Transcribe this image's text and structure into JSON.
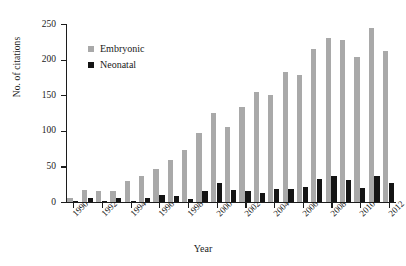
{
  "chart_data": {
    "type": "bar",
    "title": "",
    "xlabel": "Year",
    "ylabel": "No. of citations",
    "ylim": [
      0,
      250
    ],
    "yticks": [
      0,
      50,
      100,
      150,
      200,
      250
    ],
    "grid": false,
    "legend_position": "top-left-inside",
    "categories": [
      "1990",
      "1991",
      "1992",
      "1993",
      "1994",
      "1995",
      "1996",
      "1997",
      "1998",
      "1999",
      "2000",
      "2001",
      "2002",
      "2003",
      "2004",
      "2005",
      "2006",
      "2007",
      "2008",
      "2009",
      "2010",
      "2011",
      "2012"
    ],
    "xtick_labels": [
      "1990",
      "1992",
      "1994",
      "1996",
      "1998",
      "2000",
      "2002",
      "2004",
      "2006",
      "2008",
      "2010",
      "2012"
    ],
    "series": [
      {
        "name": "Embryonic",
        "color": "#a9a9a9",
        "values": [
          5,
          17,
          15,
          16,
          29,
          37,
          46,
          59,
          73,
          97,
          125,
          105,
          134,
          154,
          150,
          182,
          178,
          215,
          230,
          228,
          204,
          244,
          212
        ]
      },
      {
        "name": "Neonatal",
        "color": "#141414",
        "values": [
          1,
          6,
          2,
          6,
          2,
          6,
          10,
          8,
          4,
          16,
          27,
          17,
          16,
          12,
          18,
          18,
          21,
          32,
          36,
          31,
          20,
          37,
          27
        ]
      }
    ]
  }
}
